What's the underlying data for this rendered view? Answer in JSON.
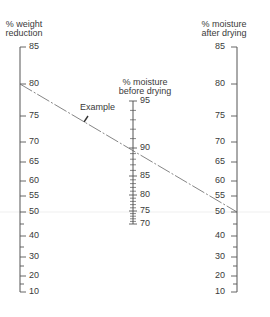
{
  "diagram": {
    "type": "nomogram",
    "colors": {
      "axis": "#555555",
      "text": "#3a3a3a",
      "example_line": "#666666",
      "guide": "#eeeeee"
    },
    "scales": [
      {
        "id": "weight_reduction",
        "title_line1": "% weight",
        "title_line2": "reduction",
        "x": 20,
        "label_side": "right",
        "ticks": [
          {
            "v": 85,
            "y": 47,
            "label": "85"
          },
          {
            "v": 80,
            "y": 84,
            "label": "80"
          },
          {
            "v": 75,
            "y": 116,
            "label": "75"
          },
          {
            "v": 70,
            "y": 142,
            "label": "70"
          },
          {
            "v": 65,
            "y": 162,
            "label": "65"
          },
          {
            "v": 60,
            "y": 181,
            "label": "60"
          },
          {
            "v": 55,
            "y": 196,
            "label": "55"
          },
          {
            "v": 50,
            "y": 212,
            "label": "50"
          },
          {
            "v": 45,
            "y": 224,
            "label": ""
          },
          {
            "v": 40,
            "y": 236,
            "label": "40"
          },
          {
            "v": 35,
            "y": 247,
            "label": ""
          },
          {
            "v": 30,
            "y": 257,
            "label": "30"
          },
          {
            "v": 25,
            "y": 266,
            "label": ""
          },
          {
            "v": 20,
            "y": 276,
            "label": "20"
          },
          {
            "v": 15,
            "y": 284,
            "label": ""
          },
          {
            "v": 10,
            "y": 292,
            "label": "10"
          }
        ]
      },
      {
        "id": "moisture_before",
        "title_line1": "% moisture",
        "title_line2": "before drying",
        "x": 133,
        "label_side": "right",
        "ticks": [
          {
            "v": 95,
            "y": 101,
            "label": "95"
          },
          {
            "v": 90,
            "y": 148,
            "label": "90"
          },
          {
            "v": 85,
            "y": 176,
            "label": "85"
          },
          {
            "v": 80,
            "y": 195,
            "label": "80"
          },
          {
            "v": 75,
            "y": 211,
            "label": "75"
          },
          {
            "v": 70,
            "y": 224,
            "label": "70"
          }
        ]
      },
      {
        "id": "moisture_after",
        "title_line1": "% moisture",
        "title_line2": "after drying",
        "x": 237,
        "label_side": "left",
        "ticks": [
          {
            "v": 85,
            "y": 47,
            "label": "85"
          },
          {
            "v": 80,
            "y": 84,
            "label": "80"
          },
          {
            "v": 75,
            "y": 116,
            "label": "75"
          },
          {
            "v": 70,
            "y": 142,
            "label": "70"
          },
          {
            "v": 65,
            "y": 162,
            "label": "65"
          },
          {
            "v": 60,
            "y": 181,
            "label": "60"
          },
          {
            "v": 55,
            "y": 196,
            "label": "55"
          },
          {
            "v": 50,
            "y": 212,
            "label": "50"
          },
          {
            "v": 45,
            "y": 224,
            "label": ""
          },
          {
            "v": 40,
            "y": 236,
            "label": "40"
          },
          {
            "v": 35,
            "y": 247,
            "label": ""
          },
          {
            "v": 30,
            "y": 257,
            "label": "30"
          },
          {
            "v": 25,
            "y": 266,
            "label": ""
          },
          {
            "v": 20,
            "y": 276,
            "label": "20"
          },
          {
            "v": 15,
            "y": 284,
            "label": ""
          },
          {
            "v": 10,
            "y": 292,
            "label": "10"
          }
        ]
      }
    ],
    "example": {
      "label": "Example",
      "weight_reduction": 80,
      "moisture_before": 90,
      "moisture_after": 50
    }
  }
}
